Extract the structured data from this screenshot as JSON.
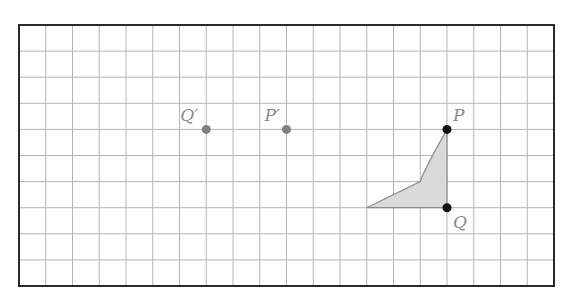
{
  "diagram": {
    "type": "grid-translation",
    "grid": {
      "columns": 20,
      "rows": 10,
      "left": 19,
      "top": 25,
      "right": 554,
      "bottom": 286,
      "line_color": "#b5b5b5",
      "border_color": "#2a2a2a"
    },
    "points": [
      {
        "id": "P",
        "label": "P",
        "col": 16,
        "row": 4,
        "color": "#111111",
        "label_dx": 6,
        "label_dy": -8
      },
      {
        "id": "Q",
        "label": "Q",
        "col": 16,
        "row": 7,
        "color": "#111111",
        "label_dx": 6,
        "label_dy": 20
      },
      {
        "id": "P_prime",
        "label": "P′",
        "col": 10,
        "row": 4,
        "color": "#808080",
        "label_dx": -22,
        "label_dy": -8
      },
      {
        "id": "Q_prime",
        "label": "Q′",
        "col": 7,
        "row": 4,
        "color": "#808080",
        "label_dx": -26,
        "label_dy": -8
      }
    ],
    "shape": {
      "name": "shaded-triangle",
      "vertices": [
        [
          16,
          4
        ],
        [
          15,
          6
        ],
        [
          13,
          7
        ],
        [
          16,
          7
        ]
      ],
      "fill": "#d9d9d9",
      "stroke": "#8c8c8c"
    }
  }
}
